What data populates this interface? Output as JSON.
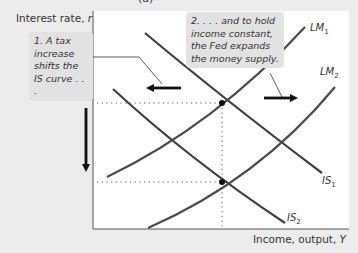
{
  "title_fragment": "(a)",
  "axes": {
    "y_label_text": "Interest rate, ",
    "y_label_var": "r",
    "x_label_text": "Income, output, ",
    "x_label_var": "Y"
  },
  "callouts": [
    {
      "id": 1,
      "text": "1. A tax increase shifts the IS curve . . ."
    },
    {
      "id": 2,
      "text": "2. . . . and to hold income constant, the Fed expands the money supply."
    }
  ],
  "curves": [
    {
      "name": "LM",
      "sub": "1",
      "color": "#4a4a4a"
    },
    {
      "name": "LM",
      "sub": "2",
      "color": "#4a4a4a"
    },
    {
      "name": "IS",
      "sub": "1",
      "color": "#3a3a3a"
    },
    {
      "name": "IS",
      "sub": "2",
      "color": "#3a3a3a"
    }
  ],
  "arrows": [
    {
      "id": "is-shift-left",
      "direction": "left"
    },
    {
      "id": "lm-shift-right",
      "direction": "right"
    },
    {
      "id": "interest-rate-falls",
      "direction": "down"
    }
  ],
  "equilibria": [
    {
      "label": "initial",
      "x_px": 222,
      "y_px": 103
    },
    {
      "label": "final",
      "x_px": 222,
      "y_px": 182
    }
  ],
  "colors": {
    "background": "#ececec",
    "plot": "#ffffff",
    "callout": "#e2e2e2",
    "curve": "#3f3f3f",
    "arrow": "#111111"
  }
}
